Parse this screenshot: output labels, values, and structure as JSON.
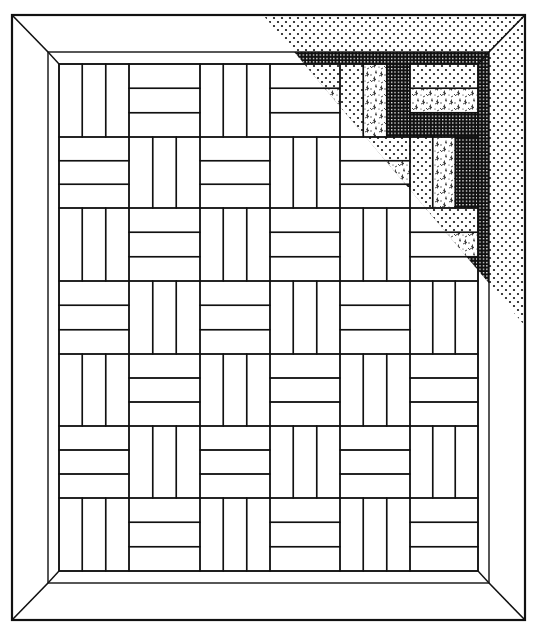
{
  "colors": {
    "background": "#ffffff",
    "line": "#111111",
    "dot": "#111111",
    "grid_bg": "#111111",
    "grid_line": "#ffffff",
    "floral": "#333333"
  },
  "layout": {
    "outer": {
      "x1": 12,
      "y1": 15,
      "x2": 525,
      "y2": 620
    },
    "inner_border": {
      "x1": 48,
      "y1": 52,
      "x2": 489,
      "y2": 583
    },
    "field": {
      "x1": 59,
      "y1": 64,
      "x2": 478,
      "y2": 571
    },
    "columns": [
      59,
      129,
      200,
      270,
      340,
      410,
      478
    ],
    "rows": [
      64,
      137,
      208,
      281,
      354,
      426,
      498,
      571
    ]
  },
  "blocks": {
    "cols": 6,
    "rows": 7,
    "strips_per_block": 3,
    "orientation_rule": "vertical when (row+col) is even, horizontal when odd",
    "grid": [
      [
        "vertical",
        "horizontal",
        "vertical",
        "horizontal",
        "vertical",
        "horizontal"
      ],
      [
        "horizontal",
        "vertical",
        "horizontal",
        "vertical",
        "horizontal",
        "vertical"
      ],
      [
        "vertical",
        "horizontal",
        "vertical",
        "horizontal",
        "vertical",
        "horizontal"
      ],
      [
        "horizontal",
        "vertical",
        "horizontal",
        "vertical",
        "horizontal",
        "vertical"
      ],
      [
        "vertical",
        "horizontal",
        "vertical",
        "horizontal",
        "vertical",
        "horizontal"
      ],
      [
        "horizontal",
        "vertical",
        "horizontal",
        "vertical",
        "horizontal",
        "vertical"
      ],
      [
        "vertical",
        "horizontal",
        "vertical",
        "horizontal",
        "vertical",
        "horizontal"
      ]
    ]
  },
  "shading": {
    "description": "Fabric preview triangle in the upper-right corner",
    "diagonal": {
      "x1": 263,
      "y1": 15,
      "x2": 525,
      "y2": 326
    },
    "strip_fabrics": [
      "dots",
      "floral",
      "grid"
    ],
    "inner_border_fabric": "grid",
    "outer_border_fabric": "dots"
  }
}
